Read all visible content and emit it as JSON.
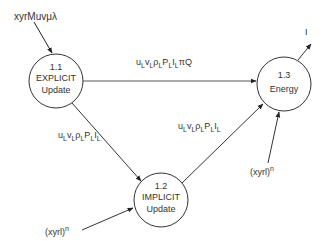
{
  "diagram": {
    "type": "data-flow",
    "nodes": [
      {
        "id": "1.1",
        "number": "1.1",
        "line1": "EXPLICIT",
        "line2": "Update"
      },
      {
        "id": "1.2",
        "number": "1.2",
        "line1": "IMPLICIT",
        "line2": "Update"
      },
      {
        "id": "1.3",
        "number": "1.3",
        "line1": "Energy",
        "line2": ""
      }
    ],
    "inputs": {
      "explicit_in": "xyrMuvμλ",
      "implicit_in_base": "(xyrl)",
      "implicit_in_sup": "n",
      "energy_in_base": "(xyrl)",
      "energy_in_sup": "n"
    },
    "outputs": {
      "energy_out": "I"
    },
    "edges": {
      "e11_13": {
        "from": "1.1",
        "to": "1.3",
        "label": "uLvLρLPLILπQ"
      },
      "e11_12": {
        "from": "1.1",
        "to": "1.2",
        "label": "uLvLρLPLIL"
      },
      "e12_13": {
        "from": "1.2",
        "to": "1.3",
        "label": "uLvLρLPLIL"
      }
    }
  }
}
